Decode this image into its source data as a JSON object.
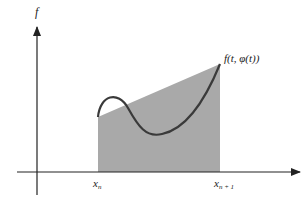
{
  "diagram": {
    "y_axis_label": "f",
    "curve_label": "f(t, φ(t))",
    "x_labels": {
      "left": "x",
      "left_sub": "n",
      "right": "x",
      "right_sub": "n + 1"
    },
    "colors": {
      "shade": "#a9a9a9",
      "curve": "#3a3a3a",
      "axes": "#222222"
    }
  }
}
